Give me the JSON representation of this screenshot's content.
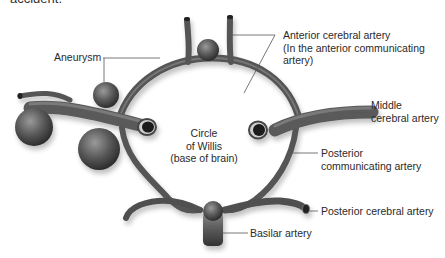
{
  "header": {
    "cut_text": "accident."
  },
  "diagram": {
    "title_center": [
      "Circle",
      "of Willis",
      "(base of brain)"
    ],
    "labels": {
      "aneurysm": "Aneurysm",
      "anterior_cerebral": [
        "Anterior cerebral artery",
        "(In the anterior communicating",
        "artery)"
      ],
      "middle_cerebral": [
        "Middle",
        "cerebral artery"
      ],
      "posterior_communicating": [
        "Posterior",
        "communicating artery"
      ],
      "posterior_cerebral": "Posterior cerebral artery",
      "basilar": "Basilar artery"
    },
    "colors": {
      "vessel_dark": "#3a3a3a",
      "vessel_mid": "#6e6e6e",
      "vessel_light": "#a8a8a8",
      "leader_line": "#555555",
      "text": "#2a2a2a"
    }
  }
}
